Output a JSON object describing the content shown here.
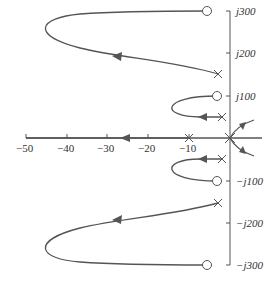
{
  "figure": {
    "type": "root-locus",
    "colors": {
      "line": "#555555",
      "text": "#333333",
      "background": "#ffffff"
    }
  },
  "axes": {
    "real": {
      "tick_labels": [
        "−50",
        "−40",
        "−30",
        "−20",
        "−10"
      ],
      "tick_values": [
        -50,
        -40,
        -30,
        -20,
        -10
      ]
    },
    "imaginary": {
      "tick_labels_pos": [
        "j300",
        "j200",
        "j100"
      ],
      "tick_labels_neg": [
        "−j100",
        "−j200",
        "−j300"
      ],
      "tick_values": [
        300,
        200,
        100,
        -100,
        -200,
        -300
      ]
    }
  },
  "poles": [
    {
      "re": 0,
      "im": 0
    },
    {
      "re": -10,
      "im": 0
    },
    {
      "re": -3,
      "im": 150
    },
    {
      "re": -3,
      "im": -150
    },
    {
      "re": -2,
      "im": 50
    },
    {
      "re": -2,
      "im": -50
    }
  ],
  "zeros": [
    {
      "re": -6,
      "im": 300
    },
    {
      "re": -6,
      "im": -300
    },
    {
      "re": -3,
      "im": 100
    },
    {
      "re": -3,
      "im": -100
    }
  ]
}
